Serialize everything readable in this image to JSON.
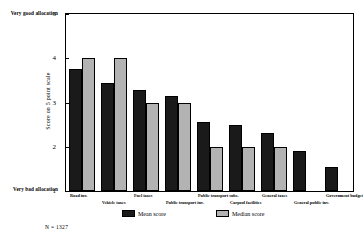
{
  "axis": {
    "top_anchor": "Very good allocation",
    "bottom_anchor": "Very bad allocation",
    "y_title": "Score on 5 point scale",
    "ticks": [
      "5",
      "4",
      "3",
      "2",
      "1"
    ]
  },
  "legend": {
    "mean_label": "Mean score",
    "median_label": "Median score",
    "mean_color": "#1a1a1a",
    "median_color": "#b3b3b3"
  },
  "footnote": "N = 1327",
  "categories_staggered": [
    {
      "label": "Road inv.",
      "row": 0
    },
    {
      "label": "Vehicle taxes",
      "row": 1
    },
    {
      "label": "Fuel taxes",
      "row": 0
    },
    {
      "label": "Public transport inv.",
      "row": 1
    },
    {
      "label": "Public transport subs.",
      "row": 0
    },
    {
      "label": "Carpool facilities",
      "row": 1
    },
    {
      "label": "General taxes",
      "row": 0
    },
    {
      "label": "General public inv.",
      "row": 1
    },
    {
      "label": "Government budget",
      "row": 0
    }
  ],
  "chart_data": {
    "type": "bar",
    "title": "",
    "xlabel": "",
    "ylabel": "Score on 5 point scale",
    "ylim": [
      1,
      5
    ],
    "yticks": [
      1,
      2,
      3,
      4,
      5
    ],
    "grid": false,
    "legend_position": "bottom",
    "categories": [
      "Road inv.",
      "Vehicle taxes",
      "Fuel taxes",
      "Public transport inv.",
      "Public transport subs.",
      "Carpool facilities",
      "General taxes",
      "General public inv.",
      "Government budget"
    ],
    "series": [
      {
        "name": "Mean score",
        "color": "#1a1a1a",
        "values": [
          3.75,
          3.45,
          3.28,
          3.15,
          2.55,
          2.5,
          2.3,
          1.9,
          1.55
        ]
      },
      {
        "name": "Median score",
        "color": "#b3b3b3",
        "values": [
          4.0,
          4.0,
          3.0,
          3.0,
          2.0,
          2.0,
          2.0,
          null,
          null
        ]
      }
    ],
    "annotations": [
      "Very good allocation (5)",
      "Very bad allocation (1)",
      "N = 1327"
    ]
  }
}
